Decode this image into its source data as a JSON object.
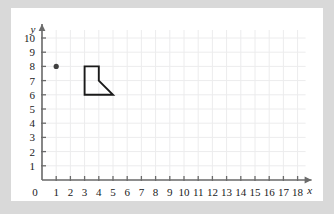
{
  "figure": {
    "background_color": "#d9d9d9",
    "card_color": "#ffffff",
    "grid_color": "#ececed",
    "axis_color": "#6b6b6b",
    "ink_color": "#1a1a1a"
  },
  "chart_data": {
    "type": "scatter",
    "title": "",
    "xlabel": "x",
    "ylabel": "y",
    "xlim": [
      0,
      18
    ],
    "ylim": [
      0,
      10
    ],
    "grid": true,
    "legend": "none",
    "x_tick_labels": [
      "0",
      "1",
      "2",
      "3",
      "4",
      "5",
      "6",
      "7",
      "8",
      "9",
      "10",
      "11",
      "12",
      "13",
      "14",
      "15",
      "16",
      "17",
      "18"
    ],
    "y_tick_labels": [
      "0",
      "1",
      "2",
      "3",
      "4",
      "5",
      "6",
      "7",
      "8",
      "9",
      "10"
    ],
    "x_ticks": [
      0,
      1,
      2,
      3,
      4,
      5,
      6,
      7,
      8,
      9,
      10,
      11,
      12,
      13,
      14,
      15,
      16,
      17,
      18
    ],
    "y_ticks": [
      0,
      1,
      2,
      3,
      4,
      5,
      6,
      7,
      8,
      9,
      10
    ],
    "origin_label": "0",
    "series": [
      {
        "name": "point",
        "type": "scatter",
        "color": "#404040",
        "points": [
          {
            "x": 1,
            "y": 8
          }
        ]
      },
      {
        "name": "polygon",
        "type": "polygon",
        "color": "#1a1a1a",
        "fill": "none",
        "vertices": [
          {
            "x": 3,
            "y": 8
          },
          {
            "x": 4,
            "y": 8
          },
          {
            "x": 4,
            "y": 7
          },
          {
            "x": 5,
            "y": 6
          },
          {
            "x": 3,
            "y": 6
          }
        ]
      }
    ]
  }
}
